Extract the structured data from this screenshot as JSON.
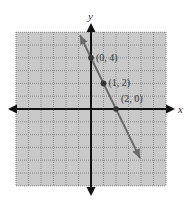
{
  "chart_data": {
    "type": "line",
    "title": "",
    "xlabel": "x",
    "ylabel": "y",
    "xlim": [
      -6,
      6
    ],
    "ylim": [
      -6,
      6
    ],
    "grid": true,
    "grid_style": "dotted",
    "legend": null,
    "series": [
      {
        "name": "y = -2x + 4",
        "x": [
          -0.88,
          3.92
        ],
        "y": [
          5.76,
          -3.84
        ],
        "arrows_both_ends": true
      }
    ],
    "points": [
      {
        "x": 0,
        "y": 4,
        "label": "(0, 4)"
      },
      {
        "x": 1,
        "y": 2,
        "label": "(1, 2)"
      },
      {
        "x": 2,
        "y": 0,
        "label": "(2, 0)"
      }
    ]
  },
  "colors": {
    "grid_background": "#c9c9c9",
    "grid_lines": "#8a8a8a",
    "axes": "#111111",
    "line": "#6a6a6a",
    "points": "#333333",
    "labels": "#333333"
  }
}
